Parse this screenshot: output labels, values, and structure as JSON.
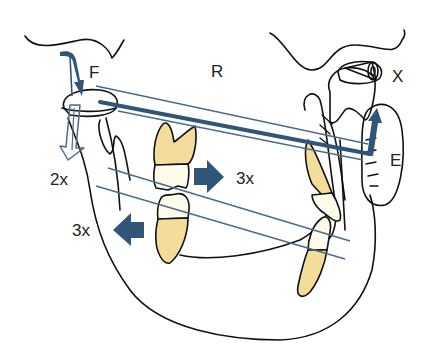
{
  "labels": {
    "F": "F",
    "R": "R",
    "X": "X",
    "E": "E",
    "left_2x": "2x",
    "arrow_right_3x": "3x",
    "arrow_left_3x": "3x"
  },
  "colors": {
    "arrow_blue": "#2f5679",
    "line_blue": "#4a6b8c",
    "tooth_yellow": "#f4dc9a",
    "tooth_crown": "#fdfbe9",
    "outline": "#111111"
  }
}
